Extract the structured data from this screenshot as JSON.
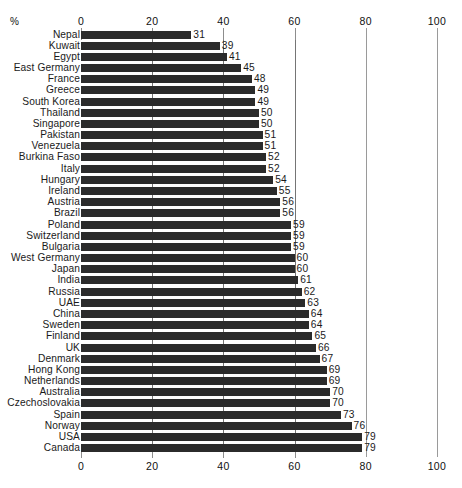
{
  "axis": {
    "unit_symbol": "%",
    "ticks": [
      0,
      20,
      40,
      60,
      80,
      100
    ],
    "tick_labels": [
      "0",
      "20",
      "40",
      "60",
      "80",
      "100"
    ]
  },
  "chart_data": {
    "type": "bar",
    "orientation": "horizontal",
    "title": "",
    "xlabel": "%",
    "ylabel": "",
    "xlim": [
      0,
      100
    ],
    "grid": true,
    "legend": "none",
    "bar_color": "#2b2b2b",
    "categories": [
      "Nepal",
      "Kuwait",
      "Egypt",
      "East Germany",
      "France",
      "Greece",
      "South Korea",
      "Thailand",
      "Singapore",
      "Pakistan",
      "Venezuela",
      "Burkina Faso",
      "Italy",
      "Hungary",
      "Ireland",
      "Austria",
      "Brazil",
      "Poland",
      "Switzerland",
      "Bulgaria",
      "West Germany",
      "Japan",
      "India",
      "Russia",
      "UAE",
      "China",
      "Sweden",
      "Finland",
      "UK",
      "Denmark",
      "Hong Kong",
      "Netherlands",
      "Australia",
      "Czechoslovakia",
      "Spain",
      "Norway",
      "USA",
      "Canada"
    ],
    "values": [
      31,
      39,
      41,
      45,
      48,
      49,
      49,
      50,
      50,
      51,
      51,
      52,
      52,
      54,
      55,
      56,
      56,
      59,
      59,
      59,
      60,
      60,
      61,
      62,
      63,
      64,
      64,
      65,
      66,
      67,
      69,
      69,
      70,
      70,
      73,
      76,
      79,
      79
    ]
  }
}
